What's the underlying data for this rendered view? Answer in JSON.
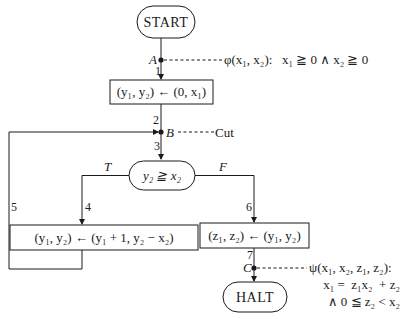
{
  "diagram": {
    "type": "flowchart",
    "nodes": {
      "start": {
        "label": "START"
      },
      "assign1": {
        "label": "(y₁, y₂) ← (0, x₁)"
      },
      "decision": {
        "label": "y₂ ≧ x₂"
      },
      "assign_loop": {
        "label": "(y₁, y₂) ← (y₁ + 1, y₂ − x₂)"
      },
      "assign_out": {
        "label": "(z₁, z₂) ← (y₁, y₂)"
      },
      "halt": {
        "label": "HALT"
      }
    },
    "points": {
      "A": {
        "label": "A",
        "annotation": "φ(x₁, x₂):   x₁ ≧ 0 ∧ x₂ ≧ 0"
      },
      "B": {
        "label": "B",
        "annotation": "Cut"
      },
      "C": {
        "label": "C",
        "annotation_line1": "ψ(x₁, x₂, z₁, z₂):",
        "annotation_line2": "x₁ =  z₁x₂  + z₂",
        "annotation_line3": "∧ 0 ≦ z₂ < x₂"
      }
    },
    "edges": {
      "e1": "1",
      "e2": "2",
      "e3": "3",
      "e4": "4",
      "e5": "5",
      "e6": "6",
      "e7": "7"
    },
    "branches": {
      "true": "T",
      "false": "F"
    },
    "colors": {
      "stroke": "#1a1a1a",
      "background": "#ffffff"
    }
  }
}
